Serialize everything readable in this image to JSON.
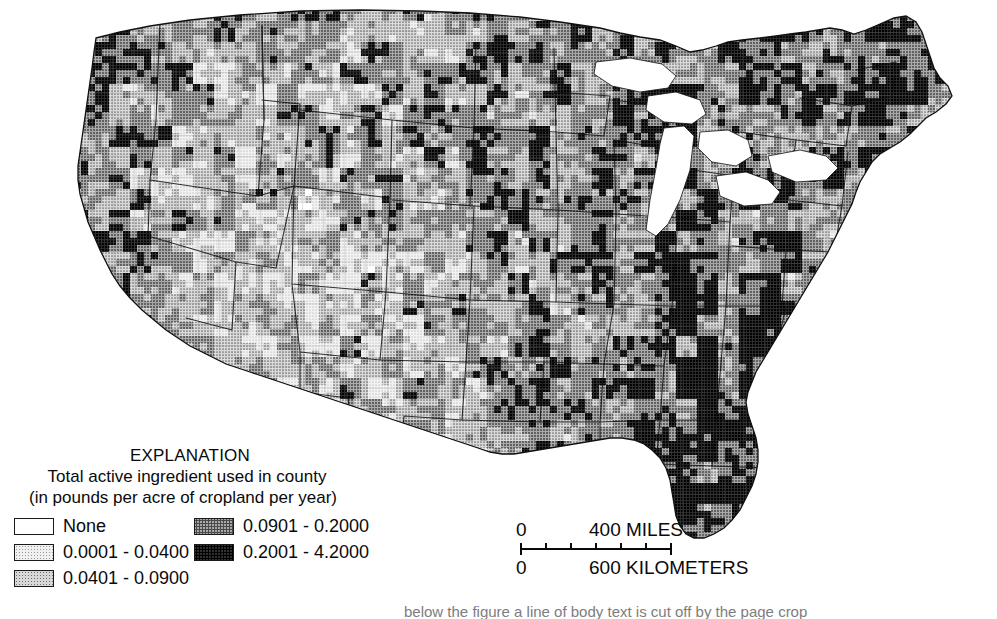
{
  "figure": {
    "kind": "choropleth-map",
    "region": "Conterminous United States, by county",
    "projection": "Albers Equal-Area Conic"
  },
  "legend": {
    "title": "EXPLANATION",
    "subtitle_line1": "Total active ingredient used in county",
    "subtitle_line2": "(in pounds per acre of cropland per year)",
    "classes_left": [
      {
        "label": "None",
        "swatch": "sw-none",
        "color": "#ffffff",
        "min": null,
        "max": null
      },
      {
        "label": "0.0001 - 0.0400",
        "swatch": "sw-c1",
        "color": "#e8e8e8",
        "min": 0.0001,
        "max": 0.04
      },
      {
        "label": "0.0401 - 0.0900",
        "swatch": "sw-c2",
        "color": "#c6c6c6",
        "min": 0.0401,
        "max": 0.09
      }
    ],
    "classes_right": [
      {
        "label": "0.0901 - 0.2000",
        "swatch": "sw-c3",
        "color": "#9a9a9a",
        "min": 0.0901,
        "max": 0.2
      },
      {
        "label": "0.2001 - 4.2000",
        "swatch": "sw-c4",
        "color": "#262626",
        "min": 0.2001,
        "max": 4.2
      }
    ]
  },
  "scalebar": {
    "miles_zero": "0",
    "miles_label": "400 MILES",
    "km_zero": "0",
    "km_label": "600 KILOMETERS",
    "miles_max": 400,
    "km_max": 600,
    "tick_positions_px": [
      0,
      24,
      48,
      72,
      96,
      120,
      150
    ]
  },
  "footer": {
    "clipped_caption": "below the figure a line of body text is cut off by the page crop"
  },
  "colors": {
    "background": "#ffffff",
    "outline": "#1a1a1a",
    "county_line": "#6e6e6e",
    "state_line": "#111111",
    "text": "#0a0a0a"
  },
  "chart_data": {
    "type": "heatmap",
    "title": "Total active ingredient used in county (in pounds per acre of cropland per year)",
    "legend_position": "bottom-left",
    "categories": [
      "None",
      "0.0001 - 0.0400",
      "0.0401 - 0.0900",
      "0.0901 - 0.2000",
      "0.2001 - 4.2000"
    ],
    "class_colors": [
      "#ffffff",
      "#e8e8e8",
      "#c6c6c6",
      "#9a9a9a",
      "#262626"
    ],
    "class_bounds": [
      [
        null,
        null
      ],
      [
        0.0001,
        0.04
      ],
      [
        0.0401,
        0.09
      ],
      [
        0.0901,
        0.2
      ],
      [
        0.2001,
        4.2
      ]
    ],
    "units": "pounds per acre of cropland per year",
    "regions": [
      {
        "name": "Washington",
        "dominant_class": "0.0901 - 0.2000"
      },
      {
        "name": "Oregon",
        "dominant_class": "0.2001 - 4.2000"
      },
      {
        "name": "California",
        "dominant_class": "0.2001 - 4.2000"
      },
      {
        "name": "Idaho",
        "dominant_class": "0.0901 - 0.2000"
      },
      {
        "name": "Nevada",
        "dominant_class": "0.0001 - 0.0400"
      },
      {
        "name": "Utah",
        "dominant_class": "0.0001 - 0.0400"
      },
      {
        "name": "Arizona",
        "dominant_class": "0.0401 - 0.0900"
      },
      {
        "name": "Montana",
        "dominant_class": "0.0401 - 0.0900"
      },
      {
        "name": "Wyoming",
        "dominant_class": "0.0401 - 0.0900"
      },
      {
        "name": "Colorado",
        "dominant_class": "0.0401 - 0.0900"
      },
      {
        "name": "New Mexico",
        "dominant_class": "0.0901 - 0.2000"
      },
      {
        "name": "North Dakota",
        "dominant_class": "0.0901 - 0.2000"
      },
      {
        "name": "South Dakota",
        "dominant_class": "0.0901 - 0.2000"
      },
      {
        "name": "Nebraska",
        "dominant_class": "0.0901 - 0.2000"
      },
      {
        "name": "Kansas",
        "dominant_class": "0.0901 - 0.2000"
      },
      {
        "name": "Oklahoma",
        "dominant_class": "0.0401 - 0.0900"
      },
      {
        "name": "Texas",
        "dominant_class": "0.0401 - 0.0900"
      },
      {
        "name": "Minnesota",
        "dominant_class": "0.0901 - 0.2000"
      },
      {
        "name": "Iowa",
        "dominant_class": "0.0901 - 0.2000"
      },
      {
        "name": "Missouri",
        "dominant_class": "0.0901 - 0.2000"
      },
      {
        "name": "Arkansas",
        "dominant_class": "0.2001 - 4.2000"
      },
      {
        "name": "Louisiana",
        "dominant_class": "0.2001 - 4.2000"
      },
      {
        "name": "Mississippi",
        "dominant_class": "0.2001 - 4.2000"
      },
      {
        "name": "Wisconsin",
        "dominant_class": "0.2001 - 4.2000"
      },
      {
        "name": "Michigan",
        "dominant_class": "0.2001 - 4.2000"
      },
      {
        "name": "Illinois",
        "dominant_class": "0.0901 - 0.2000"
      },
      {
        "name": "Indiana",
        "dominant_class": "0.0901 - 0.2000"
      },
      {
        "name": "Ohio",
        "dominant_class": "0.0401 - 0.0900"
      },
      {
        "name": "Kentucky",
        "dominant_class": "0.0901 - 0.2000"
      },
      {
        "name": "Tennessee",
        "dominant_class": "0.0901 - 0.2000"
      },
      {
        "name": "Alabama",
        "dominant_class": "0.2001 - 4.2000"
      },
      {
        "name": "Georgia",
        "dominant_class": "0.2001 - 4.2000"
      },
      {
        "name": "Florida",
        "dominant_class": "0.2001 - 4.2000"
      },
      {
        "name": "South Carolina",
        "dominant_class": "0.2001 - 4.2000"
      },
      {
        "name": "North Carolina",
        "dominant_class": "0.2001 - 4.2000"
      },
      {
        "name": "Virginia",
        "dominant_class": "0.2001 - 4.2000"
      },
      {
        "name": "West Virginia",
        "dominant_class": "0.0001 - 0.0400"
      },
      {
        "name": "Pennsylvania",
        "dominant_class": "0.0901 - 0.2000"
      },
      {
        "name": "New York",
        "dominant_class": "0.0901 - 0.2000"
      },
      {
        "name": "New England",
        "dominant_class": "0.0901 - 0.2000"
      },
      {
        "name": "Maine",
        "dominant_class": "0.2001 - 4.2000"
      }
    ]
  }
}
